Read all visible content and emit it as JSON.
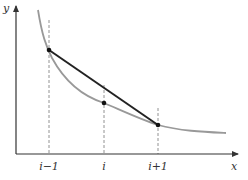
{
  "diagram": {
    "axes": {
      "x_label": "x",
      "y_label": "y"
    },
    "ticks": [
      {
        "label": "i−1",
        "x": 49
      },
      {
        "label": "i",
        "x": 104
      },
      {
        "label": "i+1",
        "x": 158
      }
    ],
    "points": [
      {
        "name": "point-i-minus-1",
        "x": 49,
        "y": 50
      },
      {
        "name": "point-i",
        "x": 104,
        "y": 103
      },
      {
        "name": "point-i-plus-1",
        "x": 158,
        "y": 125
      }
    ],
    "colors": {
      "curve": "#999999",
      "chord": "#222222",
      "axis": "#333333",
      "dashed": "#777777"
    }
  }
}
